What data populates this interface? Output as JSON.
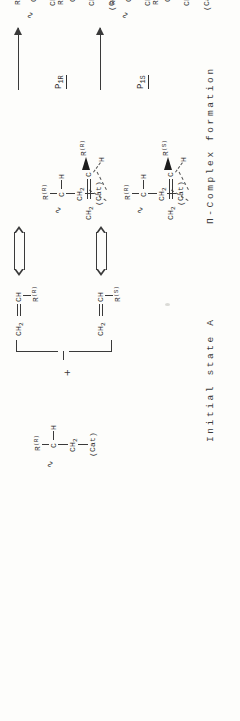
{
  "document": {
    "kind": "chemistry-reaction-scheme",
    "orientation": "rotated-90-ccw",
    "title_text": ""
  },
  "captions": {
    "initial": "Initial state A",
    "complex": "Π-Complex formation",
    "final": "Final state B"
  },
  "tags": {
    "p1r": {
      "base": "P",
      "sub": "1R"
    },
    "p1s": {
      "base": "P",
      "sub": "1S"
    },
    "brr": {
      "base": "B",
      "sub": "RR"
    },
    "brs": {
      "base": "B",
      "sub": "RS"
    }
  },
  "operators": {
    "plus": "+"
  },
  "atoms": {
    "ch2": "CH",
    "ch2_sub": "2",
    "ch": "CH",
    "c": "C",
    "h": "H",
    "r": "R",
    "cat": "(Cat)",
    "r_R": "R",
    "r_R_conf": "(R)",
    "r_S_conf": "(S)",
    "dash": "—"
  },
  "catalyst": {
    "name": "growing-chain-catalyst",
    "chain_end": "∿",
    "r_label": "R",
    "r_conf": "(R)",
    "center": "C",
    "h": "H",
    "ch2": "CH",
    "ch2_sub": "2",
    "cat": "(Cat)"
  },
  "monomers": [
    {
      "name": "monomer-R",
      "formula_a": "CH",
      "formula_a_sub": "2",
      "formula_b": "CH",
      "r": "R",
      "conf": "(R)"
    },
    {
      "name": "monomer-S",
      "formula_a": "CH",
      "formula_a_sub": "2",
      "formula_b": "CH",
      "r": "R",
      "conf": "(S)"
    }
  ],
  "complexes": [
    {
      "name": "pi-complex-R",
      "tag": "P",
      "tag_sub": "1R",
      "olefin_ch2": "CH",
      "olefin_ch2_sub": "2",
      "olefin_c": "C",
      "olefin_r": "R",
      "olefin_conf": "(R)",
      "olefin_h": "H",
      "cat": "(Cat)",
      "chain_end": "∿",
      "chain_r": "R",
      "chain_conf": "(R)",
      "chain_c": "C",
      "chain_h": "H",
      "chain_ch2": "CH",
      "chain_ch2_sub": "2"
    },
    {
      "name": "pi-complex-S",
      "tag": "P",
      "tag_sub": "1S",
      "olefin_ch2": "CH",
      "olefin_ch2_sub": "2",
      "olefin_c": "C",
      "olefin_r": "R",
      "olefin_conf": "(S)",
      "olefin_h": "H",
      "cat": "(Cat)",
      "chain_end": "∿",
      "chain_r": "R",
      "chain_conf": "(R)",
      "chain_c": "C",
      "chain_h": "H",
      "chain_ch2": "CH",
      "chain_ch2_sub": "2"
    }
  ],
  "products": [
    {
      "name": "product-RR",
      "tag": "B",
      "tag_sub": "RR",
      "chain_end": "∿",
      "u1_r": "R",
      "u1_conf": "(R)",
      "u1_c": "C",
      "u1_h": "H",
      "link_ch2": "CH",
      "link_ch2_sub": "2",
      "u2_r": "R",
      "u2_conf": "(R)",
      "u2_c": "C",
      "u2_h": "H",
      "tail_ch2": "CH",
      "tail_ch2_sub": "2",
      "cat": "(Cat)"
    },
    {
      "name": "product-RS",
      "tag": "B",
      "tag_sub": "RS",
      "chain_end": "∿",
      "u1_r": "R",
      "u1_conf": "(R)",
      "u1_c": "C",
      "u1_h": "H",
      "link_ch2": "CH",
      "link_ch2_sub": "2",
      "u2_r": "R",
      "u2_conf": "(S)",
      "u2_c": "C",
      "u2_h": "H",
      "tail_ch2": "CH",
      "tail_ch2_sub": "2",
      "cat": "(Cat)"
    }
  ],
  "colors": {
    "ink": "#2b2b2b",
    "paper": "#fdfdfb",
    "rule": "#3a3a3a"
  }
}
